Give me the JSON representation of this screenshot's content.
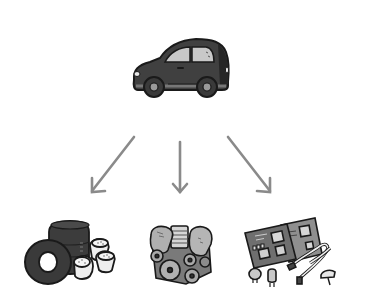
{
  "diagram": {
    "type": "breakdown",
    "background": "#ffffff",
    "source": {
      "name": "car",
      "icon": "car-icon",
      "color": "#3d3d3d"
    },
    "arrows": {
      "count": 3,
      "color": "#8a8a8a"
    },
    "parts": [
      {
        "name": "tires-and-wheels",
        "icon": "tires-icon"
      },
      {
        "name": "engine",
        "icon": "engine-icon"
      },
      {
        "name": "electronics-and-circuit-boards",
        "icon": "circuit-boards-icon"
      }
    ]
  }
}
